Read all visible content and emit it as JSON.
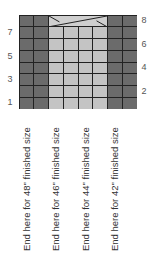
{
  "chart_title": "",
  "grid": {
    "columns": 8,
    "rows": 8,
    "column_types": [
      "dark",
      "dark",
      "light",
      "light",
      "light",
      "light",
      "dark",
      "dark"
    ],
    "cable_row": 8,
    "cable_columns": [
      3,
      4,
      5,
      6
    ],
    "colors": {
      "dark": "#6b6b6b",
      "light": "#c4c4c4",
      "cable_bg": "#cfcfcf",
      "grid_line": "#222222"
    }
  },
  "row_numbers": {
    "left": [
      "7",
      "5",
      "3",
      "1"
    ],
    "right": [
      "8",
      "6",
      "4",
      "2"
    ]
  },
  "size_labels": [
    "End here for 48\" finished size",
    "End here for 46\" finished size",
    "End here for 44\" finished size",
    "End here for 42\" finished size"
  ]
}
